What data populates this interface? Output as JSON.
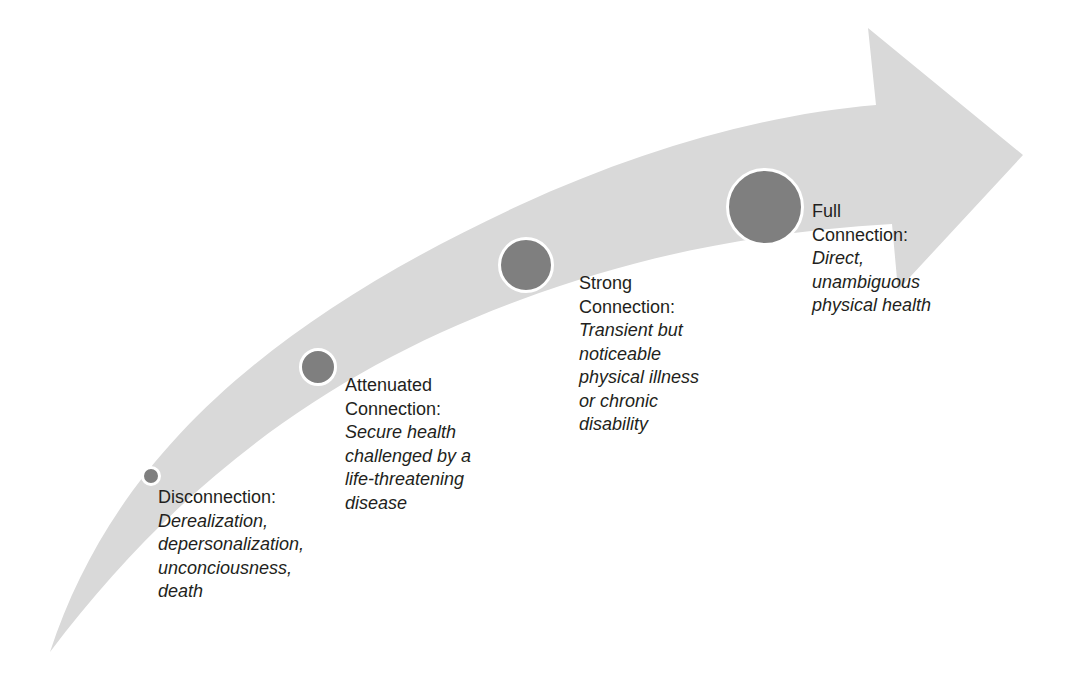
{
  "diagram": {
    "type": "curved-progress-arrow",
    "colors": {
      "arrow_fill": "#d9d9d9",
      "node_fill": "#7f7f7f",
      "node_ring": "#ffffff",
      "text": "#231f20",
      "background": "#ffffff"
    },
    "stages": [
      {
        "title": "Disconnection:",
        "description_lines": [
          "Derealization,",
          "depersonalization,",
          "unconciousness,",
          "death"
        ],
        "node": {
          "cx": 151,
          "cy": 476,
          "r": 10
        },
        "label_pos": {
          "left": 158,
          "top": 486
        }
      },
      {
        "title_lines": [
          "Attenuated",
          "Connection:"
        ],
        "description_lines": [
          "Secure health",
          "challenged by a",
          "life-threatening",
          "disease"
        ],
        "node": {
          "cx": 318,
          "cy": 367,
          "r": 19
        },
        "label_pos": {
          "left": 345,
          "top": 374
        }
      },
      {
        "title_lines": [
          "Strong",
          "Connection:"
        ],
        "description_lines": [
          "Transient but",
          "noticeable",
          "physical illness",
          "or chronic",
          "disability"
        ],
        "node": {
          "cx": 526,
          "cy": 265,
          "r": 28
        },
        "label_pos": {
          "left": 579,
          "top": 272
        }
      },
      {
        "title_lines": [
          "Full",
          "Connection:"
        ],
        "description_lines": [
          "Direct,",
          "unambiguous",
          "physical health"
        ],
        "node": {
          "cx": 765,
          "cy": 206,
          "r": 38
        },
        "label_pos": {
          "left": 812,
          "top": 200
        }
      }
    ]
  }
}
